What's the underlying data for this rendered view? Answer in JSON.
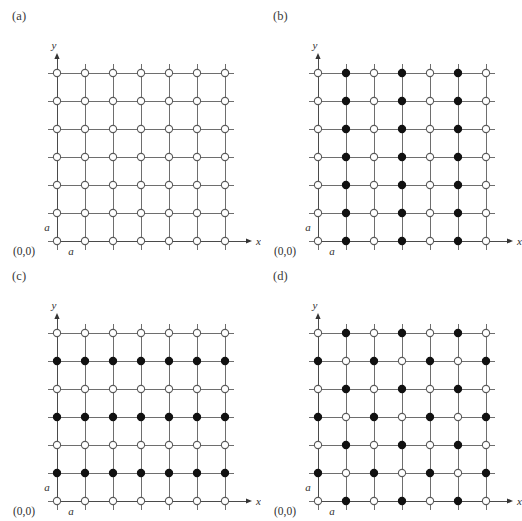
{
  "figure": {
    "background_color": "#ffffff",
    "line_color": "#6e6e6e",
    "open_site_color": "#ffffff",
    "filled_site_color": "#111111",
    "grid_columns": 7,
    "grid_rows": 7,
    "spacing_px": 28,
    "site_radius_px": 3.6
  },
  "panels": [
    {
      "id": "a",
      "label": "(a)",
      "x_axis_label": "x",
      "y_axis_label": "y",
      "origin_label": "(0,0)",
      "spacing_label_x": "a",
      "spacing_label_y": "a",
      "description": "all-open square lattice",
      "sites": [
        [
          "open",
          "open",
          "open",
          "open",
          "open",
          "open",
          "open"
        ],
        [
          "open",
          "open",
          "open",
          "open",
          "open",
          "open",
          "open"
        ],
        [
          "open",
          "open",
          "open",
          "open",
          "open",
          "open",
          "open"
        ],
        [
          "open",
          "open",
          "open",
          "open",
          "open",
          "open",
          "open"
        ],
        [
          "open",
          "open",
          "open",
          "open",
          "open",
          "open",
          "open"
        ],
        [
          "open",
          "open",
          "open",
          "open",
          "open",
          "open",
          "open"
        ],
        [
          "open",
          "open",
          "open",
          "open",
          "open",
          "open",
          "open"
        ]
      ]
    },
    {
      "id": "b",
      "label": "(b)",
      "x_axis_label": "x",
      "y_axis_label": "y",
      "origin_label": "(0,0)",
      "spacing_label_x": "a",
      "spacing_label_y": "a",
      "description": "alternating columns filled",
      "sites": [
        [
          "open",
          "filled",
          "open",
          "filled",
          "open",
          "filled",
          "open"
        ],
        [
          "open",
          "filled",
          "open",
          "filled",
          "open",
          "filled",
          "open"
        ],
        [
          "open",
          "filled",
          "open",
          "filled",
          "open",
          "filled",
          "open"
        ],
        [
          "open",
          "filled",
          "open",
          "filled",
          "open",
          "filled",
          "open"
        ],
        [
          "open",
          "filled",
          "open",
          "filled",
          "open",
          "filled",
          "open"
        ],
        [
          "open",
          "filled",
          "open",
          "filled",
          "open",
          "filled",
          "open"
        ],
        [
          "open",
          "filled",
          "open",
          "filled",
          "open",
          "filled",
          "open"
        ]
      ]
    },
    {
      "id": "c",
      "label": "(c)",
      "x_axis_label": "x",
      "y_axis_label": "y",
      "origin_label": "(0,0)",
      "spacing_label_x": "a",
      "spacing_label_y": "a",
      "description": "alternating rows filled",
      "sites": [
        [
          "open",
          "open",
          "open",
          "open",
          "open",
          "open",
          "open"
        ],
        [
          "filled",
          "filled",
          "filled",
          "filled",
          "filled",
          "filled",
          "filled"
        ],
        [
          "open",
          "open",
          "open",
          "open",
          "open",
          "open",
          "open"
        ],
        [
          "filled",
          "filled",
          "filled",
          "filled",
          "filled",
          "filled",
          "filled"
        ],
        [
          "open",
          "open",
          "open",
          "open",
          "open",
          "open",
          "open"
        ],
        [
          "filled",
          "filled",
          "filled",
          "filled",
          "filled",
          "filled",
          "filled"
        ],
        [
          "open",
          "open",
          "open",
          "open",
          "open",
          "open",
          "open"
        ]
      ]
    },
    {
      "id": "d",
      "label": "(d)",
      "x_axis_label": "x",
      "y_axis_label": "y",
      "origin_label": "(0,0)",
      "spacing_label_x": "a",
      "spacing_label_y": "a",
      "description": "checkerboard pattern",
      "sites": [
        [
          "open",
          "filled",
          "open",
          "filled",
          "open",
          "filled",
          "open"
        ],
        [
          "filled",
          "open",
          "filled",
          "open",
          "filled",
          "open",
          "filled"
        ],
        [
          "open",
          "filled",
          "open",
          "filled",
          "open",
          "filled",
          "open"
        ],
        [
          "filled",
          "open",
          "filled",
          "open",
          "filled",
          "open",
          "filled"
        ],
        [
          "open",
          "filled",
          "open",
          "filled",
          "open",
          "filled",
          "open"
        ],
        [
          "filled",
          "open",
          "filled",
          "open",
          "filled",
          "open",
          "filled"
        ],
        [
          "open",
          "filled",
          "open",
          "filled",
          "open",
          "filled",
          "open"
        ]
      ]
    }
  ]
}
